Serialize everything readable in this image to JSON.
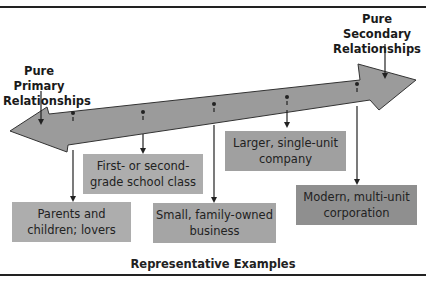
{
  "diagram": {
    "left_label": "Pure Primary\nRelationships",
    "right_label": "Pure Secondary\nRelationships",
    "caption": "Representative Examples",
    "colors": {
      "arrow_fill": "#9a9a9a",
      "box_light": "#adadad",
      "box_mid": "#a3a3a3",
      "box_dark": "#8f8f8f",
      "line": "#222222"
    },
    "examples": [
      {
        "line1": "Parents and",
        "line2": "children; lovers"
      },
      {
        "line1": "First- or second-",
        "line2": "grade school class"
      },
      {
        "line1": "Small, family-owned",
        "line2": "business"
      },
      {
        "line1": "Larger, single-unit",
        "line2": "company"
      },
      {
        "line1": "Modern, multi-unit",
        "line2": "corporation"
      }
    ]
  }
}
